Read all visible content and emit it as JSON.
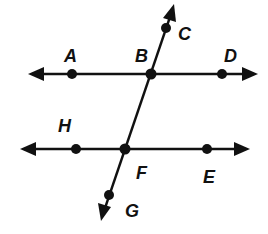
{
  "diagram": {
    "type": "geometry-parallel-lines-transversal",
    "lines": [
      {
        "id": "line-AD",
        "points": [
          "A",
          "B",
          "D"
        ],
        "label": "line AD"
      },
      {
        "id": "line-HE",
        "points": [
          "H",
          "F",
          "E"
        ],
        "label": "line HE"
      },
      {
        "id": "transversal-CG",
        "points": [
          "C",
          "B",
          "F",
          "G"
        ],
        "label": "line CG"
      }
    ],
    "points": {
      "A": {
        "label": "A"
      },
      "B": {
        "label": "B"
      },
      "C": {
        "label": "C"
      },
      "D": {
        "label": "D"
      },
      "H": {
        "label": "H"
      },
      "F": {
        "label": "F"
      },
      "E": {
        "label": "E"
      },
      "G": {
        "label": "G"
      }
    },
    "colors": {
      "ink": "#111111",
      "background": "#ffffff"
    }
  }
}
